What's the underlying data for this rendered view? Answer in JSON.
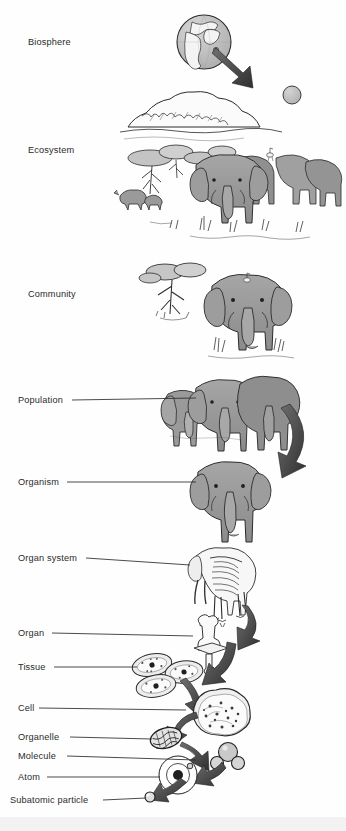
{
  "figure": {
    "background_color": "#fefefe",
    "ink_color": "#2b2b2b",
    "fill_gray": "#9a9a9a",
    "fill_light": "#c9c9c9",
    "arrow_dark": "#4a4a4a"
  },
  "levels": [
    {
      "id": "biosphere",
      "label": "Biosphere",
      "label_x": 28,
      "label_y": 38,
      "leader": false,
      "illustration": "earth-globe-icon"
    },
    {
      "id": "ecosystem",
      "label": "Ecosystem",
      "label_x": 28,
      "label_y": 146,
      "leader": false,
      "illustration": "savanna-scene-icon"
    },
    {
      "id": "community",
      "label": "Community",
      "label_x": 28,
      "label_y": 290,
      "leader": false,
      "illustration": "tree-and-elephant-icon"
    },
    {
      "id": "population",
      "label": "Population",
      "label_x": 18,
      "label_y": 396,
      "leader": true,
      "leader_x2": 196,
      "illustration": "elephant-herd-icon"
    },
    {
      "id": "organism",
      "label": "Organism",
      "label_x": 18,
      "label_y": 478,
      "leader": true,
      "leader_x2": 196,
      "illustration": "single-elephant-icon"
    },
    {
      "id": "organ-system",
      "label": "Organ system",
      "label_x": 18,
      "label_y": 554,
      "leader": true,
      "leader_x2": 190,
      "illustration": "elephant-skeleton-icon"
    },
    {
      "id": "organ",
      "label": "Organ",
      "label_x": 18,
      "label_y": 629,
      "leader": true,
      "leader_x2": 193,
      "illustration": "bone-icon"
    },
    {
      "id": "tissue",
      "label": "Tissue",
      "label_x": 18,
      "label_y": 663,
      "leader": true,
      "leader_x2": 138,
      "illustration": "tissue-cells-icon"
    },
    {
      "id": "cell",
      "label": "Cell",
      "label_x": 18,
      "label_y": 704,
      "leader": true,
      "leader_x2": 180,
      "illustration": "cell-icon"
    },
    {
      "id": "organelle",
      "label": "Organelle",
      "label_x": 18,
      "label_y": 733,
      "leader": true,
      "leader_x2": 152,
      "illustration": "organelle-icon"
    },
    {
      "id": "molecule",
      "label": "Molecule",
      "label_x": 18,
      "label_y": 752,
      "leader": true,
      "leader_x2": 196,
      "illustration": "molecule-icon"
    },
    {
      "id": "atom",
      "label": "Atom",
      "label_x": 18,
      "label_y": 773,
      "leader": true,
      "leader_x2": 198,
      "illustration": "atom-icon"
    },
    {
      "id": "subatomic-particle",
      "label": "Subatomic particle",
      "label_x": 10,
      "label_y": 796,
      "leader": true,
      "leader_x2": 148,
      "illustration": "subatomic-particle-icon"
    }
  ],
  "arrows": [
    {
      "id": "globe-to-ecosystem",
      "from": "biosphere",
      "to": "ecosystem",
      "direction": "down-right"
    },
    {
      "id": "population-to-organism",
      "from": "population",
      "to": "organism",
      "direction": "down-left"
    },
    {
      "id": "organsystem-to-organ",
      "from": "organ-system",
      "to": "organ",
      "direction": "down-left"
    },
    {
      "id": "organ-to-tissue",
      "from": "organ",
      "to": "tissue",
      "direction": "down-left"
    },
    {
      "id": "tissue-to-cell",
      "from": "tissue",
      "to": "cell",
      "direction": "down-right"
    },
    {
      "id": "cell-to-organelle",
      "from": "cell",
      "to": "organelle",
      "direction": "down-left"
    },
    {
      "id": "organelle-to-molecule",
      "from": "organelle",
      "to": "molecule",
      "direction": "down-right"
    },
    {
      "id": "molecule-to-atom",
      "from": "molecule",
      "to": "atom",
      "direction": "down-left"
    },
    {
      "id": "atom-to-subatomic",
      "from": "atom",
      "to": "subatomic-particle",
      "direction": "down-left"
    }
  ],
  "scene_elements": {
    "ecosystem": [
      "mountain",
      "sun",
      "acacia-trees",
      "rhinoceros",
      "elephant-herd",
      "egret-bird",
      "grass"
    ],
    "community": [
      "acacia-tree",
      "elephant",
      "egret-bird",
      "grass"
    ],
    "population": [
      "elephant",
      "elephant",
      "elephant"
    ]
  }
}
